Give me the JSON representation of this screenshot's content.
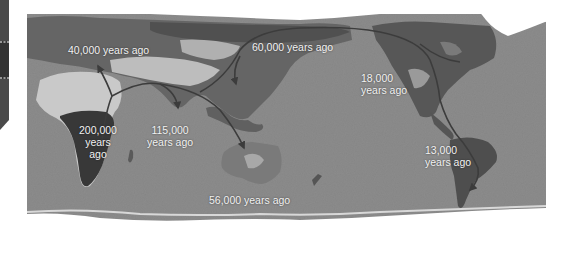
{
  "map": {
    "title": "Human migration routes",
    "colors": {
      "ocean": "#8c8c8c",
      "land_dark": "#555555",
      "land_mid": "#6e6e6e",
      "desert": "#c9c9c9",
      "ice": "#ffffff",
      "africa_highlight": "#3a3a3a",
      "route": "#3c3c3c",
      "label": "#f2f2f2",
      "side_tab": "#4a4a4a"
    },
    "labels": [
      {
        "id": "europe",
        "lines": [
          "40,000 years ago"
        ]
      },
      {
        "id": "africa",
        "lines": [
          "200,000",
          "years",
          "ago"
        ]
      },
      {
        "id": "south-asia",
        "lines": [
          "115,000",
          "years ago"
        ]
      },
      {
        "id": "east-asia",
        "lines": [
          "60,000 years ago"
        ]
      },
      {
        "id": "north-america",
        "lines": [
          "18,000",
          "years ago"
        ]
      },
      {
        "id": "south-america",
        "lines": [
          "13,000",
          "years ago"
        ]
      },
      {
        "id": "australia",
        "lines": [
          "56,000 years ago"
        ]
      }
    ]
  }
}
